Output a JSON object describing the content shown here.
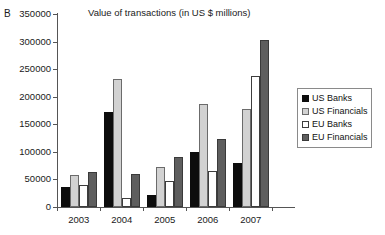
{
  "panel_label": "B",
  "chart_data": {
    "type": "bar",
    "title": "Value of transactions (in US $ millions)",
    "xlabel": "",
    "ylabel": "",
    "categories": [
      "2003",
      "2004",
      "2005",
      "2006",
      "2007"
    ],
    "series": [
      {
        "name": "US Banks",
        "color": "#0d0d0d",
        "values": [
          37000,
          172000,
          21000,
          100000,
          80000
        ]
      },
      {
        "name": "US Financials",
        "color": "#d2d2d2",
        "values": [
          58000,
          232000,
          72000,
          186000,
          178000
        ]
      },
      {
        "name": "EU Banks",
        "color": "#ffffff",
        "values": [
          40000,
          17000,
          48000,
          66000,
          238000
        ]
      },
      {
        "name": "EU Financials",
        "color": "#5e5e5e",
        "values": [
          63000,
          60000,
          90000,
          123000,
          303000
        ]
      }
    ],
    "ylim": [
      0,
      350000
    ],
    "yticks": [
      0,
      50000,
      100000,
      150000,
      200000,
      250000,
      300000,
      350000
    ],
    "ytick_labels": [
      "0",
      "50000",
      "100000",
      "150000",
      "200000",
      "250000",
      "300000",
      "350000"
    ],
    "grid": false,
    "legend_position": "right"
  }
}
